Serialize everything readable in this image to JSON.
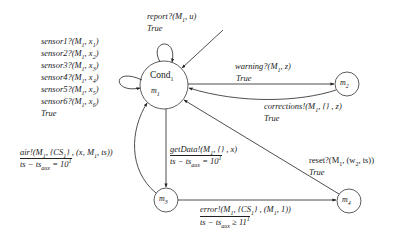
{
  "diagram": {
    "type": "state-machine",
    "states": [
      {
        "id": "cond1",
        "name": "Cond",
        "name_sub": "1",
        "mode": "m",
        "mode_sub": "1",
        "initial": true
      },
      {
        "id": "m2",
        "name": "m",
        "name_sub": "2"
      },
      {
        "id": "m3",
        "name": "m",
        "name_sub": "3"
      },
      {
        "id": "m4",
        "name": "m",
        "name_sub": "4"
      }
    ],
    "transitions": {
      "report": {
        "from": "cond1",
        "to": "cond1",
        "action": "report?(M",
        "action_sub": "1",
        "action_tail": ", u)",
        "guard": "True"
      },
      "sensors": {
        "from": "cond1",
        "to": "cond1",
        "lines": [
          {
            "pre": "sensor1?(M",
            "sub1": "1",
            "mid": ", x",
            "sub2": "1",
            "post": ")"
          },
          {
            "pre": "sensor2?(M",
            "sub1": "1",
            "mid": ", x",
            "sub2": "2",
            "post": ")"
          },
          {
            "pre": "sensor3?(M",
            "sub1": "1",
            "mid": ", x",
            "sub2": "3",
            "post": ")"
          },
          {
            "pre": "sensor4?(M",
            "sub1": "1",
            "mid": ", x",
            "sub2": "4",
            "post": ")"
          },
          {
            "pre": "sensor5?(M",
            "sub1": "1",
            "mid": ", x",
            "sub2": "5",
            "post": ")"
          },
          {
            "pre": "sensor6?(M",
            "sub1": "1",
            "mid": ", x",
            "sub2": "6",
            "post": ")"
          }
        ],
        "guard": "True"
      },
      "warning": {
        "from": "cond1",
        "to": "m2",
        "action": "warning?(M",
        "action_sub": "1",
        "action_tail": ", z)",
        "guard": "True"
      },
      "corrections": {
        "from": "m2",
        "to": "cond1",
        "action": "corrections!(M",
        "action_sub": "1",
        "action_tail": ", {} , z)",
        "guard": "True"
      },
      "reset": {
        "from": "m4",
        "to": "cond1",
        "action": "reset?(M",
        "action_sub": "1",
        "action_mid": ", (w",
        "action_sub2": "2",
        "action_tail": ", ts))",
        "guard": "True"
      },
      "getData": {
        "from": "cond1",
        "to": "m3",
        "action": "getData!(M",
        "action_sub": "1",
        "action_tail": ", {} , x)",
        "guard_pre": "ts − ts",
        "guard_sub": "aux",
        "guard_post": " = 10",
        "guard_sup": "1"
      },
      "air": {
        "from": "m3",
        "to": "cond1",
        "action": "air!(M",
        "action_sub": "1",
        "action_mid": ", {CS",
        "action_sub2": "1",
        "action_tail": "} , (x, M",
        "action_sub3": "1",
        "action_tail2": ", ts))",
        "guard_pre": "ts − ts",
        "guard_sub": "aux",
        "guard_post": " = 10",
        "guard_sup": "1"
      },
      "error": {
        "from": "m3",
        "to": "m4",
        "action": "error!(M",
        "action_sub": "1",
        "action_mid": ", {CS",
        "action_sub2": "1",
        "action_tail": "} , (M",
        "action_sub3": "1",
        "action_tail2": ", 1))",
        "guard_pre": "ts − ts",
        "guard_sub": "aux",
        "guard_post": " ≥ 11",
        "guard_sup": "1"
      }
    },
    "colors": {
      "stroke": "#222222",
      "text": "#1a1a1a",
      "background": "#ffffff"
    }
  }
}
